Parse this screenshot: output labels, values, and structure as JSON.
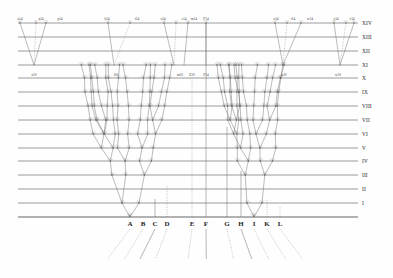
{
  "figure": {
    "background": "#fefefe",
    "line_color": "#4a4a4a",
    "branch_color": "#6a6a6a",
    "width": 393,
    "height": 278
  },
  "levels": {
    "label": "Geological formations / generations",
    "items": [
      {
        "numeral": "XIV",
        "y": 23
      },
      {
        "numeral": "XIII",
        "y": 37
      },
      {
        "numeral": "XII",
        "y": 51
      },
      {
        "numeral": "XI",
        "y": 65
      },
      {
        "numeral": "X",
        "y": 78
      },
      {
        "numeral": "IX",
        "y": 92
      },
      {
        "numeral": "VIII",
        "y": 106
      },
      {
        "numeral": "VII",
        "y": 120
      },
      {
        "numeral": "VI",
        "y": 134
      },
      {
        "numeral": "V",
        "y": 148
      },
      {
        "numeral": "IV",
        "y": 161
      },
      {
        "numeral": "III",
        "y": 175
      },
      {
        "numeral": "II",
        "y": 189
      },
      {
        "numeral": "I",
        "y": 203
      }
    ],
    "baseline_y": 217,
    "numeral_x": 362,
    "line_x_start": 18,
    "line_x_end": 358
  },
  "species": {
    "label": "Original species on the baseline",
    "items": [
      {
        "letter": "A",
        "x": 130,
        "has_tree": true,
        "stem": "dotted"
      },
      {
        "letter": "B",
        "x": 143,
        "has_tree": false,
        "stem": "dotted"
      },
      {
        "letter": "C",
        "x": 155,
        "has_tree": false,
        "stem": "solid"
      },
      {
        "letter": "D",
        "x": 167,
        "has_tree": false,
        "stem": "dotted"
      },
      {
        "letter": "E",
        "x": 192,
        "has_tree": false,
        "stem": "dotted"
      },
      {
        "letter": "F",
        "x": 206,
        "has_tree": false,
        "stem": "solid"
      },
      {
        "letter": "G",
        "x": 227,
        "has_tree": false,
        "stem": "dotted"
      },
      {
        "letter": "H",
        "x": 241,
        "has_tree": false,
        "stem": "solid"
      },
      {
        "letter": "I",
        "x": 254,
        "has_tree": true,
        "stem": "dotted"
      },
      {
        "letter": "K",
        "x": 267,
        "has_tree": false,
        "stem": "dotted"
      },
      {
        "letter": "L",
        "x": 280,
        "has_tree": false,
        "stem": "dotted"
      }
    ]
  },
  "persisting_lines": {
    "label": "Unchanged lineages rising from baseline",
    "items": [
      {
        "letter": "E",
        "x": 192,
        "top_y": 78,
        "top_label": "E10"
      },
      {
        "letter": "F",
        "x": 206,
        "top_y": 23,
        "top_label": "F14"
      },
      {
        "letter": "C",
        "x": 155,
        "top_y": 199,
        "top_label": ""
      },
      {
        "letter": "D",
        "x": 167,
        "top_y": 185,
        "top_label": ""
      },
      {
        "letter": "G",
        "x": 227,
        "top_y": 127,
        "top_label": ""
      },
      {
        "letter": "H",
        "x": 241,
        "top_y": 171,
        "top_label": ""
      },
      {
        "letter": "K",
        "x": 267,
        "top_y": 199,
        "top_label": ""
      },
      {
        "letter": "L",
        "x": 280,
        "top_y": 206,
        "top_label": ""
      }
    ]
  },
  "top_terminals": {
    "label": "Fourteenth generation terminal forms",
    "row_y": 22,
    "items": [
      {
        "label": "a14",
        "x": 20
      },
      {
        "label": "q14",
        "x": 41
      },
      {
        "label": "p14",
        "x": 60
      },
      {
        "label": "b14",
        "x": 107
      },
      {
        "label": "f14",
        "x": 137
      },
      {
        "label": "o14",
        "x": 163
      },
      {
        "label": "e14",
        "x": 184
      },
      {
        "label": "m14",
        "x": 194
      },
      {
        "label": "F14",
        "x": 206
      },
      {
        "label": "n14",
        "x": 276
      },
      {
        "label": "r14",
        "x": 293
      },
      {
        "label": "w14",
        "x": 310
      },
      {
        "label": "y14",
        "x": 336
      },
      {
        "label": "v14",
        "x": 352
      }
    ]
  },
  "mid_labels": {
    "label": "Tenth generation labels",
    "row_y": 76,
    "items": [
      {
        "label": "a10",
        "x": 34
      },
      {
        "label": "f10",
        "x": 116
      },
      {
        "label": "m10",
        "x": 180
      },
      {
        "label": "E10",
        "x": 192
      },
      {
        "label": "F14",
        "x": 206
      },
      {
        "label": "n10",
        "x": 284
      },
      {
        "label": "w10",
        "x": 338
      }
    ]
  },
  "trees": {
    "label": "Diverging descendant trees",
    "roots": [
      "A",
      "I"
    ],
    "description": "Branching lineages radiating upward from species A and I across fourteen generations"
  },
  "upper_fan": {
    "label": "Upper section, generations XI to XIV",
    "groups": [
      {
        "origin_x": 34,
        "origin_y": 65,
        "fans": [
          -14,
          2,
          12
        ]
      },
      {
        "origin_x": 114,
        "origin_y": 65,
        "fans": [
          -6,
          16
        ]
      },
      {
        "origin_x": 174,
        "origin_y": 65,
        "fans": [
          -10,
          2
        ]
      },
      {
        "origin_x": 184,
        "origin_y": 65,
        "fans": [
          4
        ]
      },
      {
        "origin_x": 206,
        "origin_y": 65,
        "fans": [
          0
        ]
      },
      {
        "origin_x": 283,
        "origin_y": 65,
        "fans": [
          -8,
          4,
          18
        ]
      },
      {
        "origin_x": 340,
        "origin_y": 65,
        "fans": [
          -6,
          6,
          14
        ]
      }
    ]
  }
}
